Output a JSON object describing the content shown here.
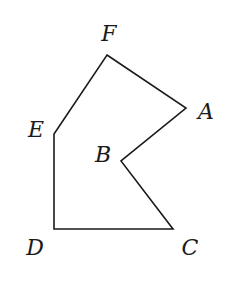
{
  "diagram": {
    "type": "polygon",
    "stroke_color": "#1a1a1a",
    "background": "#ffffff",
    "vertices": [
      {
        "name": "F",
        "x": 107,
        "y": 55,
        "label": "F",
        "label_x": 109,
        "label_y": 34
      },
      {
        "name": "A",
        "x": 186,
        "y": 108,
        "label": "A",
        "label_x": 206,
        "label_y": 112
      },
      {
        "name": "B",
        "x": 121,
        "y": 161,
        "label": "B",
        "label_x": 103,
        "label_y": 155
      },
      {
        "name": "C",
        "x": 173,
        "y": 229,
        "label": "C",
        "label_x": 190,
        "label_y": 248
      },
      {
        "name": "D",
        "x": 54,
        "y": 229,
        "label": "D",
        "label_x": 35,
        "label_y": 248
      },
      {
        "name": "E",
        "x": 54,
        "y": 134,
        "label": "E",
        "label_x": 36,
        "label_y": 130
      }
    ],
    "edges": [
      "FA",
      "AB",
      "BC",
      "CD",
      "DE",
      "EF"
    ]
  }
}
